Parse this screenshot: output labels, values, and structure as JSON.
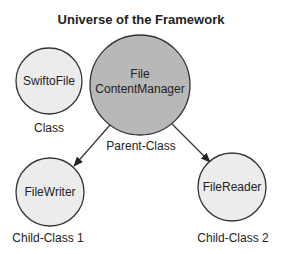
{
  "diagram": {
    "title": "Universe of the Framework",
    "colors": {
      "background": "#ffffff",
      "light_fill": "#ececec",
      "parent_fill": "#b8b8b8",
      "stroke": "#333333",
      "text": "#222222"
    },
    "nodes": [
      {
        "id": "swiftofile",
        "lines": [
          "SwiftoFile"
        ],
        "caption": "Class",
        "cx": 49,
        "cy": 81,
        "r": 33,
        "fill": "light"
      },
      {
        "id": "filecontentmanager",
        "lines": [
          "File",
          "ContentManager"
        ],
        "caption": "Parent-Class",
        "cx": 140,
        "cy": 85,
        "r": 50,
        "fill": "parent"
      },
      {
        "id": "filewriter",
        "lines": [
          "FileWriter"
        ],
        "caption": "Child-Class 1",
        "cx": 50,
        "cy": 192,
        "r": 34,
        "fill": "light"
      },
      {
        "id": "filereader",
        "lines": [
          "FileReader"
        ],
        "caption": "Child-Class 2",
        "cx": 232,
        "cy": 187,
        "r": 34,
        "fill": "light"
      }
    ],
    "edges": [
      {
        "from": "filecontentmanager",
        "to": "filewriter",
        "type": "arrow"
      },
      {
        "from": "filecontentmanager",
        "to": "filereader",
        "type": "arrow"
      }
    ]
  }
}
